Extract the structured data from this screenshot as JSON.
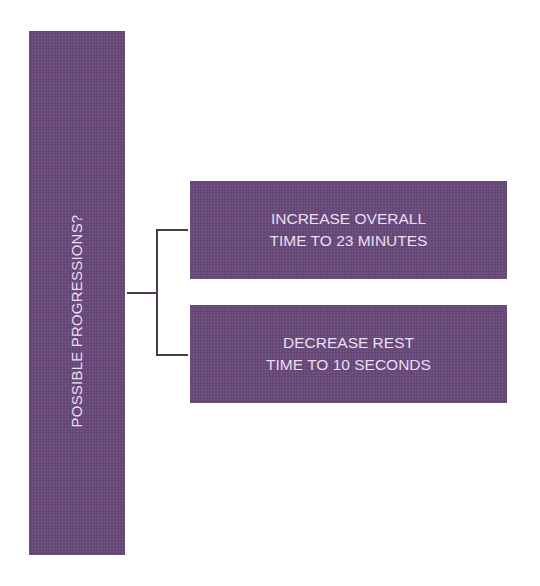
{
  "diagram": {
    "root": {
      "label": "POSSIBLE PROGRESSIONS?",
      "orientation": "vertical"
    },
    "options": [
      {
        "line1": "INCREASE OVERALL",
        "line2": "TIME TO 23 MINUTES"
      },
      {
        "line1": "DECREASE REST",
        "line2": "TIME TO 10 SECONDS"
      }
    ],
    "colors": {
      "box_fill": "#6a4a7d",
      "box_text": "#eadff0",
      "connector": "#4a3a4e",
      "background": "#ffffff"
    }
  }
}
